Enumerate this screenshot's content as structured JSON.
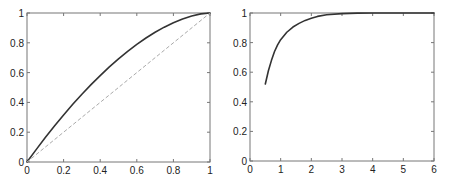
{
  "chart_data": [
    {
      "type": "line",
      "title": "",
      "xlabel": "",
      "ylabel": "",
      "xlim": [
        0,
        1
      ],
      "ylim": [
        0,
        1
      ],
      "grid": false,
      "xticks": [
        "0",
        "0.2",
        "0.4",
        "0.6",
        "0.8",
        "1"
      ],
      "yticks": [
        "0",
        "0.2",
        "0.4",
        "0.6",
        "0.8",
        "1"
      ],
      "series": [
        {
          "name": "curve",
          "style": "solid",
          "color": "#333333",
          "x": [
            0,
            0.05,
            0.1,
            0.15,
            0.2,
            0.25,
            0.3,
            0.35,
            0.4,
            0.45,
            0.5,
            0.55,
            0.6,
            0.65,
            0.7,
            0.75,
            0.8,
            0.85,
            0.9,
            0.95,
            1.0
          ],
          "y": [
            0,
            0.083,
            0.164,
            0.241,
            0.316,
            0.387,
            0.455,
            0.519,
            0.58,
            0.638,
            0.692,
            0.743,
            0.79,
            0.832,
            0.871,
            0.905,
            0.935,
            0.96,
            0.98,
            0.994,
            1.0
          ]
        },
        {
          "name": "diagonal",
          "style": "dashed",
          "color": "#aaaaaa",
          "x": [
            0,
            1
          ],
          "y": [
            0,
            1
          ]
        }
      ]
    },
    {
      "type": "line",
      "title": "",
      "xlabel": "",
      "ylabel": "",
      "xlim": [
        0,
        6
      ],
      "ylim": [
        0,
        1
      ],
      "grid": false,
      "xticks": [
        "0",
        "1",
        "2",
        "3",
        "4",
        "5",
        "6"
      ],
      "yticks": [
        "0",
        "0.2",
        "0.4",
        "0.6",
        "0.8",
        "1"
      ],
      "series": [
        {
          "name": "curve",
          "style": "solid",
          "color": "#333333",
          "x": [
            0.5,
            0.6,
            0.7,
            0.8,
            0.9,
            1.0,
            1.2,
            1.4,
            1.6,
            1.8,
            2.0,
            2.2,
            2.5,
            3.0,
            3.5,
            4.0,
            5.0,
            6.0
          ],
          "y": [
            0.52,
            0.61,
            0.68,
            0.74,
            0.785,
            0.82,
            0.87,
            0.905,
            0.93,
            0.95,
            0.965,
            0.977,
            0.988,
            0.996,
            0.999,
            1.0,
            1.0,
            1.0
          ]
        }
      ]
    }
  ]
}
